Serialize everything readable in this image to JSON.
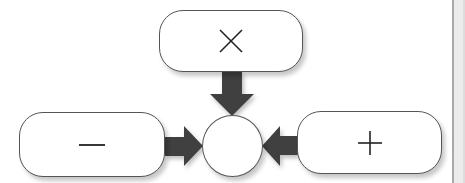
{
  "diagram": {
    "nodes": [
      {
        "id": "top",
        "shape": "rounded-rect",
        "label": "×",
        "symbol": "multiply-icon"
      },
      {
        "id": "left",
        "shape": "rounded-rect",
        "label": "−",
        "symbol": "minus-icon"
      },
      {
        "id": "right",
        "shape": "rounded-rect",
        "label": "+",
        "symbol": "plus-icon"
      },
      {
        "id": "center",
        "shape": "circle",
        "label": ""
      }
    ],
    "edges": [
      {
        "from": "top",
        "to": "center",
        "direction": "down"
      },
      {
        "from": "left",
        "to": "center",
        "direction": "right"
      },
      {
        "from": "right",
        "to": "center",
        "direction": "left"
      }
    ],
    "colors": {
      "arrow": "#404040",
      "border": "#555555",
      "panel": "#ececec"
    }
  }
}
